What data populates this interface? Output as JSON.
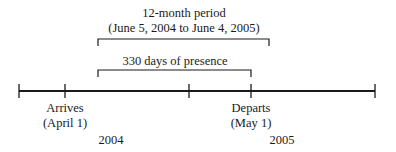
{
  "title": {
    "line1": "12-month period",
    "line2": "(June 5, 2004 to June 4, 2005)"
  },
  "inner_bracket": {
    "label": "330 days of presence"
  },
  "events": [
    {
      "name": "arrives",
      "label": "Arrives",
      "date": "(April 1)"
    },
    {
      "name": "departs",
      "label": "Departs",
      "date": "(May 1)"
    }
  ],
  "years": [
    "2004",
    "2005"
  ],
  "colors": {
    "line": "#1a1a1a",
    "text": "#1a1a1a",
    "background": "#ffffff"
  }
}
